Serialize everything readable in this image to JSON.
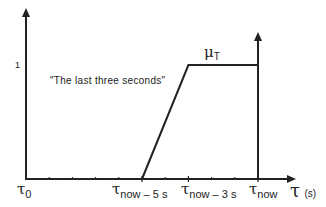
{
  "chart_data": {
    "type": "line",
    "title": "",
    "xlabel": "τ",
    "xlabel_unit": "(s)",
    "ylabel": "",
    "xlim": [
      -10,
      1.4
    ],
    "ylim": [
      0,
      1.5
    ],
    "y_ticks": [
      {
        "value": 1,
        "label": "1"
      }
    ],
    "x_ticks": [
      {
        "value": -10,
        "label_main": "τ",
        "label_sub": "0"
      },
      {
        "value": -5,
        "label_main": "τ",
        "label_sub": "now – 5 s"
      },
      {
        "value": -3,
        "label_main": "τ",
        "label_sub": "now – 3 s"
      },
      {
        "value": 0,
        "label_main": "τ",
        "label_sub": "now"
      }
    ],
    "minor_ticks": [
      -9,
      -8,
      -7,
      -6,
      -4,
      -2,
      -1
    ],
    "series": [
      {
        "name": "μT",
        "label_main": "μ",
        "label_sub": "T",
        "x": [
          -5,
          -3,
          0,
          0
        ],
        "y": [
          0,
          1,
          1,
          0
        ]
      }
    ],
    "annotations": [
      {
        "text": "\"The last three seconds\"",
        "near": "left of ramp"
      }
    ],
    "grid": false,
    "legend": "none"
  }
}
